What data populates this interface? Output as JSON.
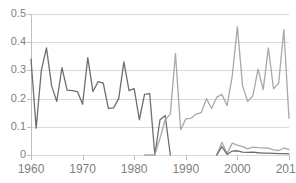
{
  "title_strip": "",
  "chart_data": {
    "type": "line",
    "title": "",
    "subtitle": "",
    "xlabel": "",
    "ylabel": "",
    "xlim": [
      1960,
      2010
    ],
    "ylim": [
      0,
      0.5
    ],
    "grid": true,
    "legend_position": "none",
    "x_tick_labels": [
      "1960",
      "1970",
      "1980",
      "1990",
      "2000",
      "2010"
    ],
    "x_ticks": [
      1960,
      1970,
      1980,
      1990,
      2000,
      2010
    ],
    "y_tick_labels": [
      "0",
      "0.1",
      "0.2",
      "0.3",
      "0.4",
      "0.5"
    ],
    "y_ticks": [
      0,
      0.1,
      0.2,
      0.3,
      0.4,
      0.5
    ],
    "colors": {
      "series_dark": "#6e6e6e",
      "series_light": "#a8a8a8",
      "gridline": "#d9d9d9",
      "axis": "#bfbfbf",
      "tick_text": "#808080",
      "background": "#ffffff"
    },
    "series": [
      {
        "name": "series-dark-early",
        "color": "#6e6e6e",
        "x": [
          1960,
          1961,
          1962,
          1963,
          1964,
          1965,
          1966,
          1967,
          1968,
          1969,
          1970,
          1971,
          1972,
          1973,
          1974,
          1975,
          1976,
          1977,
          1978,
          1979,
          1980,
          1981,
          1982,
          1983,
          1984,
          1985,
          1986,
          1987
        ],
        "values": [
          0.34,
          0.095,
          0.3,
          0.38,
          0.245,
          0.19,
          0.31,
          0.23,
          0.228,
          0.225,
          0.18,
          0.345,
          0.225,
          0.26,
          0.255,
          0.165,
          0.167,
          0.2,
          0.33,
          0.228,
          0.235,
          0.125,
          0.215,
          0.218,
          0.0,
          0.125,
          0.14,
          0.0
        ]
      },
      {
        "name": "series-light-main",
        "color": "#a8a8a8",
        "x": [
          1982,
          1983,
          1984,
          1985,
          1986,
          1987,
          1988,
          1989,
          1990,
          1991,
          1992,
          1993,
          1994,
          1995,
          1996,
          1997,
          1998,
          1999,
          2000,
          2001,
          2002,
          2003,
          2004,
          2005,
          2006,
          2007,
          2008,
          2009,
          2010
        ],
        "values": [
          0.0,
          0.0,
          0.0,
          0.06,
          0.125,
          0.145,
          0.36,
          0.09,
          0.128,
          0.13,
          0.145,
          0.15,
          0.2,
          0.165,
          0.205,
          0.215,
          0.175,
          0.28,
          0.455,
          0.245,
          0.19,
          0.21,
          0.305,
          0.232,
          0.38,
          0.235,
          0.255,
          0.445,
          0.13
        ]
      },
      {
        "name": "series-light-small",
        "color": "#a8a8a8",
        "x": [
          1996,
          1997,
          1998,
          1999,
          2000,
          2001,
          2002,
          2003,
          2004,
          2005,
          2006,
          2007,
          2008,
          2009,
          2010
        ],
        "values": [
          0.0,
          0.045,
          0.005,
          0.042,
          0.035,
          0.03,
          0.022,
          0.028,
          0.026,
          0.025,
          0.024,
          0.018,
          0.016,
          0.024,
          0.02
        ]
      },
      {
        "name": "series-dark-small",
        "color": "#6e6e6e",
        "x": [
          1996,
          1997,
          1998,
          1999,
          2000,
          2001,
          2002,
          2003,
          2004,
          2005,
          2006,
          2007,
          2008,
          2009,
          2010
        ],
        "values": [
          0.0,
          0.03,
          0.002,
          0.014,
          0.015,
          0.01,
          0.009,
          0.01,
          0.008,
          0.007,
          0.007,
          0.006,
          0.005,
          0.005,
          0.004
        ]
      }
    ]
  }
}
